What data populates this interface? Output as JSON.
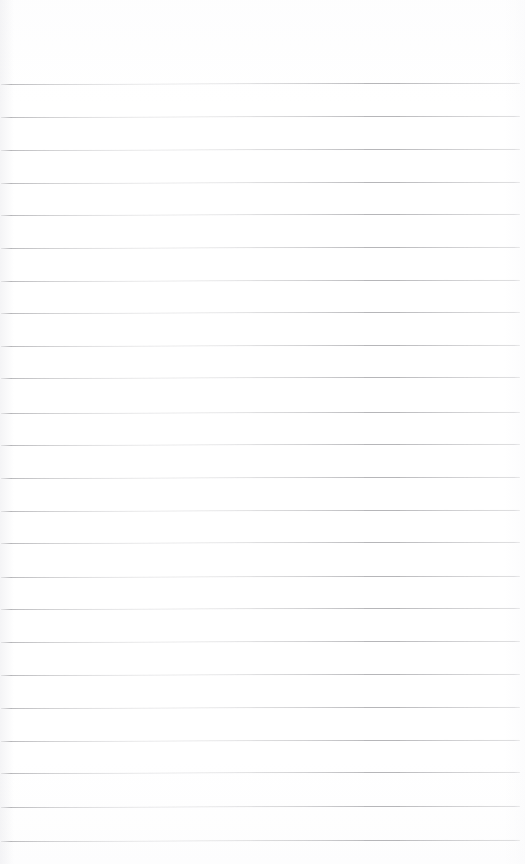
{
  "document": {
    "kind": "ruled-paper",
    "description": "Blank lined notebook paper",
    "page_width": 525,
    "page_height": 864,
    "background_color": "#ffffff",
    "has_text": false,
    "has_handwriting": false
  },
  "ruling": {
    "line_color": "#b6b6b9",
    "line_thickness": 1,
    "line_count": 24,
    "line_spacing": 32.9,
    "first_line_y": 84,
    "last_line_y": 841,
    "line_start_x": 1,
    "line_end_x": 520,
    "skew_degrees": 0.15,
    "lines": [
      {
        "index": 1,
        "y": 84
      },
      {
        "index": 2,
        "y": 117
      },
      {
        "index": 3,
        "y": 150
      },
      {
        "index": 4,
        "y": 183
      },
      {
        "index": 5,
        "y": 215
      },
      {
        "index": 6,
        "y": 248
      },
      {
        "index": 7,
        "y": 281
      },
      {
        "index": 8,
        "y": 313
      },
      {
        "index": 9,
        "y": 346
      },
      {
        "index": 10,
        "y": 378
      },
      {
        "index": 11,
        "y": 413
      },
      {
        "index": 12,
        "y": 445
      },
      {
        "index": 13,
        "y": 478
      },
      {
        "index": 14,
        "y": 511
      },
      {
        "index": 15,
        "y": 543
      },
      {
        "index": 16,
        "y": 577
      },
      {
        "index": 17,
        "y": 609
      },
      {
        "index": 18,
        "y": 642
      },
      {
        "index": 19,
        "y": 675
      },
      {
        "index": 20,
        "y": 708
      },
      {
        "index": 21,
        "y": 741
      },
      {
        "index": 22,
        "y": 773
      },
      {
        "index": 23,
        "y": 807
      },
      {
        "index": 24,
        "y": 841
      }
    ]
  },
  "margins": {
    "header_height": 83,
    "footer_height": 21,
    "right_margin": 5,
    "left_margin": 1
  }
}
